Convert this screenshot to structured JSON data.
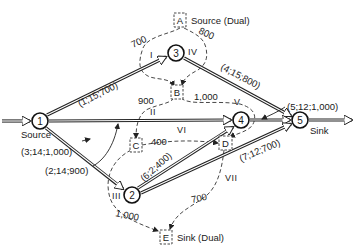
{
  "diagram": {
    "type": "network-flow-with-dual",
    "nodes": [
      {
        "id": "1",
        "label": "1",
        "role": "Source",
        "x": 40,
        "y": 121
      },
      {
        "id": "2",
        "label": "2",
        "x": 132,
        "y": 195
      },
      {
        "id": "3",
        "label": "3",
        "x": 176,
        "y": 53
      },
      {
        "id": "4",
        "label": "4",
        "x": 241,
        "y": 120
      },
      {
        "id": "5",
        "label": "5",
        "role": "Sink",
        "x": 300,
        "y": 120
      }
    ],
    "node_roles": {
      "source": "Source",
      "sink": "Sink"
    },
    "edges": [
      {
        "from": "1",
        "to": "3",
        "label": "(1;15;700)"
      },
      {
        "from": "3",
        "to": "5",
        "label": "(4;15;800)"
      },
      {
        "from": "4",
        "to": "5",
        "label": "(5;12;1,000)"
      },
      {
        "from": "1",
        "to": "4",
        "label": "(3;14;1,000)"
      },
      {
        "from": "1",
        "to": "2",
        "label": "(2;14;900)"
      },
      {
        "from": "2",
        "to": "4",
        "label": "(6;2;400)"
      },
      {
        "from": "2",
        "to": "5",
        "label": "(7;12;700)"
      }
    ],
    "dual_nodes": [
      {
        "id": "A",
        "label": "A",
        "caption": "Source (Dual)"
      },
      {
        "id": "B",
        "label": "B"
      },
      {
        "id": "C",
        "label": "C"
      },
      {
        "id": "D",
        "label": "D"
      },
      {
        "id": "E",
        "label": "E",
        "caption": "Sink (Dual)"
      }
    ],
    "dual_arcs": [
      {
        "roman": "I",
        "value": "700",
        "from": "A",
        "to": "B"
      },
      {
        "roman": "IV",
        "value": "800",
        "from": "A",
        "to": "B"
      },
      {
        "roman": "II",
        "value": "900",
        "from": "B",
        "to": "C"
      },
      {
        "roman": "V",
        "value": "1,000",
        "from": "B",
        "to": "D"
      },
      {
        "roman": "VI",
        "value": "400",
        "from": "C",
        "to": "D"
      },
      {
        "roman": "III",
        "value": "1,000",
        "from": "C",
        "to": "E"
      },
      {
        "roman": "VII",
        "value": "700",
        "from": "D",
        "to": "E"
      }
    ]
  }
}
